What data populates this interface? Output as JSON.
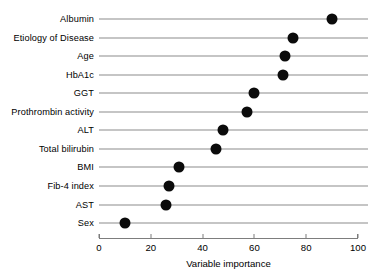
{
  "chart_data": {
    "type": "bar",
    "subtype": "lollipop-dot-plot",
    "orientation": "horizontal",
    "title": "",
    "subtitle": "",
    "xlabel": "Variable importance",
    "ylabel": "",
    "xlim": [
      0,
      100
    ],
    "xticks": [
      0,
      20,
      40,
      60,
      80,
      100
    ],
    "xticklabels": [
      "0",
      "20",
      "40",
      "60",
      "80",
      "100"
    ],
    "grid": false,
    "legend": null,
    "legend_position": "none",
    "categories": [
      "Albumin",
      "Etiology of Disease",
      "Age",
      "HbA1c",
      "GGT",
      "Prothrombin activity",
      "ALT",
      "Total bilirubin",
      "BMI",
      "Fib-4 index",
      "AST",
      "Sex"
    ],
    "values": [
      90,
      75,
      72,
      71,
      60,
      57,
      48,
      45,
      31,
      27,
      26,
      10
    ],
    "marker": {
      "shape": "circle",
      "color": "#0b0b0b",
      "size_px": 11
    },
    "line": {
      "color": "#8b8b8b",
      "width_px": 1
    },
    "axis_color": "#7d7d7d"
  },
  "colors": {
    "background": "#ffffff",
    "marker": "#0b0b0b",
    "line": "#8b8b8b",
    "axis": "#7d7d7d",
    "text": "#000000"
  }
}
